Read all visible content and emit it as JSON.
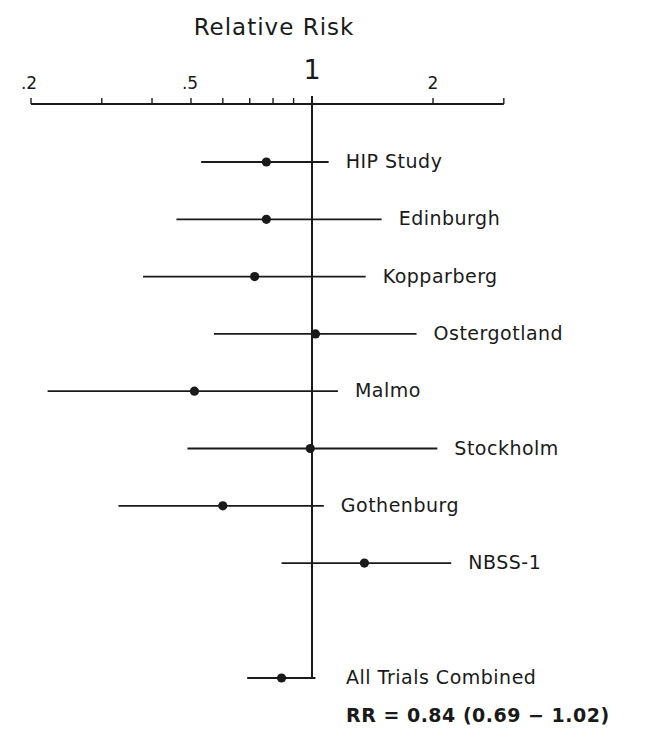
{
  "chart_data": {
    "type": "forest",
    "title": "Relative Risk",
    "xlabel": "Relative Risk",
    "ylabel": "",
    "xscale": "log",
    "xlim": [
      0.2,
      3.0
    ],
    "reference_line": 1,
    "grid": false,
    "legend": null,
    "ticks": {
      "labeled": [
        {
          "value": 0.2,
          "label": ".2"
        },
        {
          "value": 0.5,
          "label": ".5"
        },
        {
          "value": 1,
          "label": "1"
        },
        {
          "value": 2,
          "label": "2"
        }
      ],
      "minor": [
        0.3,
        0.4,
        0.6,
        0.7,
        0.8,
        0.9,
        3.0
      ]
    },
    "studies": [
      {
        "name": "HIP Study",
        "rr": 0.77,
        "lower": 0.53,
        "upper": 1.1
      },
      {
        "name": "Edinburgh",
        "rr": 0.77,
        "lower": 0.46,
        "upper": 1.49
      },
      {
        "name": "Kopparberg",
        "rr": 0.72,
        "lower": 0.38,
        "upper": 1.36
      },
      {
        "name": "Ostergotland",
        "rr": 1.02,
        "lower": 0.57,
        "upper": 1.82
      },
      {
        "name": "Malmo",
        "rr": 0.51,
        "lower": 0.22,
        "upper": 1.16
      },
      {
        "name": "Stockholm",
        "rr": 0.99,
        "lower": 0.49,
        "upper": 2.05
      },
      {
        "name": "Gothenburg",
        "rr": 0.6,
        "lower": 0.33,
        "upper": 1.07
      },
      {
        "name": "NBSS-1",
        "rr": 1.35,
        "lower": 0.84,
        "upper": 2.22
      }
    ],
    "summary": {
      "name": "All Trials Combined",
      "rr": 0.84,
      "lower": 0.69,
      "upper": 1.02,
      "annotation": "RR = 0.84 (0.69 − 1.02)"
    }
  },
  "labels": {
    "title": "Relative Risk",
    "tick_02": ".2",
    "tick_05": ".5",
    "tick_1": "1",
    "tick_2": "2",
    "studies": [
      "HIP Study",
      "Edinburgh",
      "Kopparberg",
      "Ostergotland",
      "Malmo",
      "Stockholm",
      "Gothenburg",
      "NBSS-1"
    ],
    "summary_name": "All Trials Combined",
    "summary_annotation": "RR = 0.84 (0.69 − 1.02)"
  },
  "colors": {
    "ink": "#1a1a1a",
    "background": "#ffffff"
  }
}
